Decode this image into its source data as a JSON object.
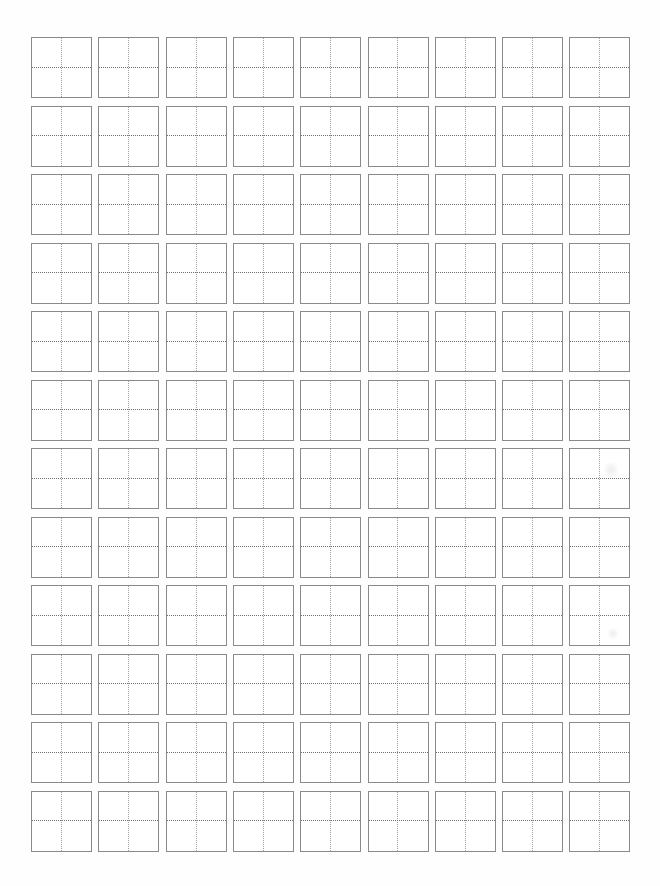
{
  "document": {
    "kind": "character-practice-grid-worksheet",
    "title": "Blank Practice Grid Sheet",
    "page_width": 660,
    "page_height": 886,
    "background_color": "#ffffff"
  },
  "grid": {
    "columns": 9,
    "rows": 12,
    "total_cells": 108,
    "origin_x": 31,
    "origin_y": 37,
    "cell_width": 61,
    "cell_height": 61,
    "column_pitch": 67.3,
    "row_pitch": 68.5,
    "border_color": "#8a8a8a",
    "border_width": 1.4,
    "vertical_guide_color": "#9e9e9e",
    "horizontal_guide_color": "#6f6f6f",
    "guide_style": "dotted",
    "cell_fill": "#ffffff",
    "row_labels": [
      "row-1",
      "row-2",
      "row-3",
      "row-4",
      "row-5",
      "row-6",
      "row-7",
      "row-8",
      "row-9",
      "row-10",
      "row-11",
      "row-12"
    ],
    "column_labels": [
      "col-1",
      "col-2",
      "col-3",
      "col-4",
      "col-5",
      "col-6",
      "col-7",
      "col-8",
      "col-9"
    ],
    "cell_contents": [
      [
        "",
        "",
        "",
        "",
        "",
        "",
        "",
        "",
        ""
      ],
      [
        "",
        "",
        "",
        "",
        "",
        "",
        "",
        "",
        ""
      ],
      [
        "",
        "",
        "",
        "",
        "",
        "",
        "",
        "",
        ""
      ],
      [
        "",
        "",
        "",
        "",
        "",
        "",
        "",
        "",
        ""
      ],
      [
        "",
        "",
        "",
        "",
        "",
        "",
        "",
        "",
        ""
      ],
      [
        "",
        "",
        "",
        "",
        "",
        "",
        "",
        "",
        ""
      ],
      [
        "",
        "",
        "",
        "",
        "",
        "",
        "",
        "",
        ""
      ],
      [
        "",
        "",
        "",
        "",
        "",
        "",
        "",
        "",
        ""
      ],
      [
        "",
        "",
        "",
        "",
        "",
        "",
        "",
        "",
        ""
      ],
      [
        "",
        "",
        "",
        "",
        "",
        "",
        "",
        "",
        ""
      ],
      [
        "",
        "",
        "",
        "",
        "",
        "",
        "",
        "",
        ""
      ],
      [
        "",
        "",
        "",
        "",
        "",
        "",
        "",
        "",
        ""
      ]
    ]
  },
  "artifacts": [
    {
      "name": "scan-smudge",
      "x": 604,
      "y": 462,
      "width": 14,
      "height": 16
    },
    {
      "name": "scan-smudge",
      "x": 608,
      "y": 628,
      "width": 10,
      "height": 11
    }
  ]
}
